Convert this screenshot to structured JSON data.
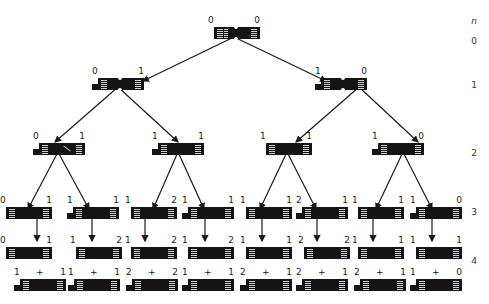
{
  "axis": {
    "title": "n",
    "levels": [
      "0",
      "1",
      "2",
      "3",
      "4"
    ]
  },
  "tree": {
    "level0": [
      {
        "left": "0",
        "right": "0"
      }
    ],
    "level1": [
      {
        "left": "0",
        "right": "1"
      },
      {
        "left": "1",
        "right": "0"
      }
    ],
    "level2": [
      {
        "left": "0",
        "right": "1"
      },
      {
        "left": "1",
        "right": "1"
      },
      {
        "left": "1",
        "right": "1"
      },
      {
        "left": "1",
        "right": "0"
      }
    ],
    "level3": [
      {
        "left": "0",
        "right": "1"
      },
      {
        "left": "1",
        "right": "1"
      },
      {
        "left": "1",
        "right": "2"
      },
      {
        "left": "1",
        "right": "1"
      },
      {
        "left": "1",
        "right": "1"
      },
      {
        "left": "2",
        "right": "1"
      },
      {
        "left": "1",
        "right": "1"
      },
      {
        "left": "1",
        "right": "0"
      }
    ],
    "level4_top": [
      {
        "left": "0",
        "right": "1"
      },
      {
        "left": "1",
        "right": "2"
      },
      {
        "left": "1",
        "right": "2"
      },
      {
        "left": "1",
        "right": "2"
      },
      {
        "left": "1",
        "right": "1"
      },
      {
        "left": "2",
        "right": "2"
      },
      {
        "left": "1",
        "right": "1"
      },
      {
        "left": "1",
        "right": "1"
      }
    ],
    "level4_bottom": [
      {
        "left": "1",
        "mid": "+",
        "right": "1"
      },
      {
        "left": "1",
        "mid": "+",
        "right": "1"
      },
      {
        "left": "2",
        "mid": "+",
        "right": "2"
      },
      {
        "left": "1",
        "mid": "+",
        "right": "1"
      },
      {
        "left": "2",
        "mid": "+",
        "right": "1"
      },
      {
        "left": "2",
        "mid": "+",
        "right": "1"
      },
      {
        "left": "2",
        "mid": "+",
        "right": "1"
      },
      {
        "left": "1",
        "mid": "+",
        "right": "0"
      }
    ]
  },
  "colors": {
    "chromosome": "#141414",
    "line": "#1a1a1a",
    "background": "#ffffff"
  }
}
